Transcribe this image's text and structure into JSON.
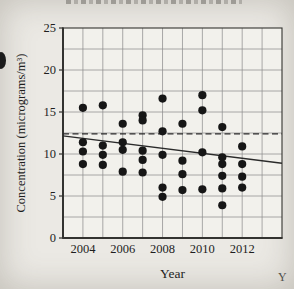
{
  "figure": {
    "x_axis_title": "Year",
    "y_axis_title": "Concentration (micrograms/m³)"
  },
  "artifacts": {
    "stray_fragment": "Y"
  },
  "chart_data": {
    "type": "scatter",
    "title": "",
    "xlabel": "Year",
    "ylabel": "Concentration (micrograms/m³)",
    "xlim": [
      2003,
      2014
    ],
    "ylim": [
      0,
      25
    ],
    "x_ticks": [
      2004,
      2006,
      2008,
      2010,
      2012
    ],
    "y_ticks": [
      0,
      5,
      10,
      15,
      20,
      25
    ],
    "grid": {
      "on": true,
      "x_step": 1,
      "y_step": 2.5
    },
    "points": [
      [
        2004,
        15.5
      ],
      [
        2004,
        11.4
      ],
      [
        2004,
        10.3
      ],
      [
        2004,
        8.8
      ],
      [
        2005,
        15.8
      ],
      [
        2005,
        11.0
      ],
      [
        2005,
        9.9
      ],
      [
        2005,
        8.7
      ],
      [
        2006,
        13.6
      ],
      [
        2006,
        11.4
      ],
      [
        2006,
        10.5
      ],
      [
        2006,
        7.9
      ],
      [
        2007,
        14.6
      ],
      [
        2007,
        14.0
      ],
      [
        2007,
        10.4
      ],
      [
        2007,
        9.3
      ],
      [
        2007,
        7.8
      ],
      [
        2008,
        16.6
      ],
      [
        2008,
        12.7
      ],
      [
        2008,
        9.9
      ],
      [
        2008,
        6.0
      ],
      [
        2008,
        4.9
      ],
      [
        2009,
        13.6
      ],
      [
        2009,
        9.2
      ],
      [
        2009,
        7.6
      ],
      [
        2009,
        5.7
      ],
      [
        2010,
        17.0
      ],
      [
        2010,
        15.2
      ],
      [
        2010,
        10.2
      ],
      [
        2010,
        5.8
      ],
      [
        2011,
        13.2
      ],
      [
        2011,
        9.6
      ],
      [
        2011,
        8.8
      ],
      [
        2011,
        7.4
      ],
      [
        2011,
        5.9
      ],
      [
        2011,
        3.9
      ],
      [
        2012,
        10.9
      ],
      [
        2012,
        8.8
      ],
      [
        2012,
        7.3
      ],
      [
        2012,
        6.0
      ]
    ],
    "dashed_line": {
      "y": 12.4
    },
    "trend_line": {
      "x1": 2003,
      "y1": 12.15,
      "x2": 2014,
      "y2": 8.9
    },
    "colors": {
      "background": "#ebe9e4",
      "plot_bg": "#f2f1ec",
      "grid": "#8f8f8f",
      "axis": "#333330",
      "dot": "#161616",
      "line": "#2a2a2a",
      "text": "#1e1e1e"
    },
    "layout": {
      "left": 63,
      "right": 282,
      "top": 28,
      "bottom": 238,
      "dot_radius": 4.1
    }
  }
}
